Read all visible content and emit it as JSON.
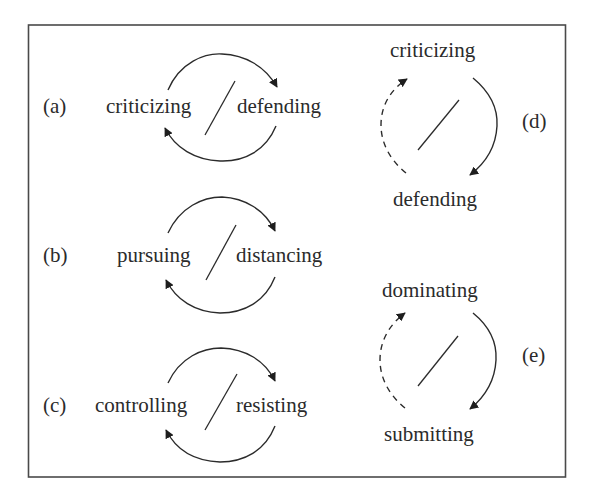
{
  "figure": {
    "panels": [
      {
        "id": "a",
        "label": "(a)",
        "orientation": "horizontal",
        "left_term": "criticizing",
        "right_term": "defending",
        "arrows": "solid both directions"
      },
      {
        "id": "b",
        "label": "(b)",
        "orientation": "horizontal",
        "left_term": "pursuing",
        "right_term": "distancing",
        "arrows": "solid both directions"
      },
      {
        "id": "c",
        "label": "(c)",
        "orientation": "horizontal",
        "left_term": "controlling",
        "right_term": "resisting",
        "arrows": "solid both directions"
      },
      {
        "id": "d",
        "label": "(d)",
        "orientation": "vertical",
        "top_term": "criticizing",
        "bottom_term": "defending",
        "arrows": "solid top-to-bottom, dashed bottom-to-top"
      },
      {
        "id": "e",
        "label": "(e)",
        "orientation": "vertical",
        "top_term": "dominating",
        "bottom_term": "submitting",
        "arrows": "solid top-to-bottom, dashed bottom-to-top"
      }
    ]
  },
  "colors": {
    "ink": "#2b2b2b",
    "frame": "#4a4a4a",
    "background": "#ffffff"
  }
}
